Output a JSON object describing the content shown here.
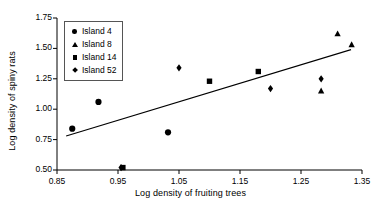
{
  "chart_data": {
    "type": "scatter",
    "title": "",
    "xlabel": "Log density of fruiting trees",
    "ylabel": "Log density of spiny rats",
    "xlim": [
      0.85,
      1.35
    ],
    "ylim": [
      0.5,
      1.75
    ],
    "xticks": [
      "0.85",
      "0.95",
      "1.05",
      "1.15",
      "1.25",
      "1.35"
    ],
    "xtick_values": [
      0.85,
      0.95,
      1.05,
      1.15,
      1.25,
      1.35
    ],
    "yticks": [
      "0.50",
      "0.75",
      "1.00",
      "1.25",
      "1.50",
      "1.75"
    ],
    "ytick_values": [
      0.5,
      0.75,
      1.0,
      1.25,
      1.5,
      1.75
    ],
    "grid": false,
    "legend_position": "top-left",
    "series": [
      {
        "name": "Island 4",
        "marker": "circle",
        "color": "#000000",
        "points": [
          {
            "x": 0.875,
            "y": 0.84
          },
          {
            "x": 0.918,
            "y": 1.06
          },
          {
            "x": 1.032,
            "y": 0.81
          }
        ]
      },
      {
        "name": "Island 8",
        "marker": "triangle",
        "color": "#000000",
        "points": [
          {
            "x": 1.283,
            "y": 1.15
          },
          {
            "x": 1.31,
            "y": 1.62
          },
          {
            "x": 1.333,
            "y": 1.53
          }
        ]
      },
      {
        "name": "Island 14",
        "marker": "square",
        "color": "#000000",
        "points": [
          {
            "x": 0.958,
            "y": 0.52
          },
          {
            "x": 1.1,
            "y": 1.23
          },
          {
            "x": 1.18,
            "y": 1.31
          }
        ]
      },
      {
        "name": "Island 52",
        "marker": "diamond",
        "color": "#000000",
        "points": [
          {
            "x": 0.955,
            "y": 0.52
          },
          {
            "x": 1.05,
            "y": 1.34
          },
          {
            "x": 1.2,
            "y": 1.17
          },
          {
            "x": 1.283,
            "y": 1.25
          }
        ]
      }
    ],
    "trendline": {
      "label": "regression line",
      "x0": 0.865,
      "y0": 0.78,
      "x1": 1.332,
      "y1": 1.49
    }
  },
  "legend": {
    "items": [
      {
        "label": "Island 4",
        "marker": "circle"
      },
      {
        "label": "Island 8",
        "marker": "triangle"
      },
      {
        "label": "Island 14",
        "marker": "square"
      },
      {
        "label": "Island 52",
        "marker": "diamond"
      }
    ]
  }
}
